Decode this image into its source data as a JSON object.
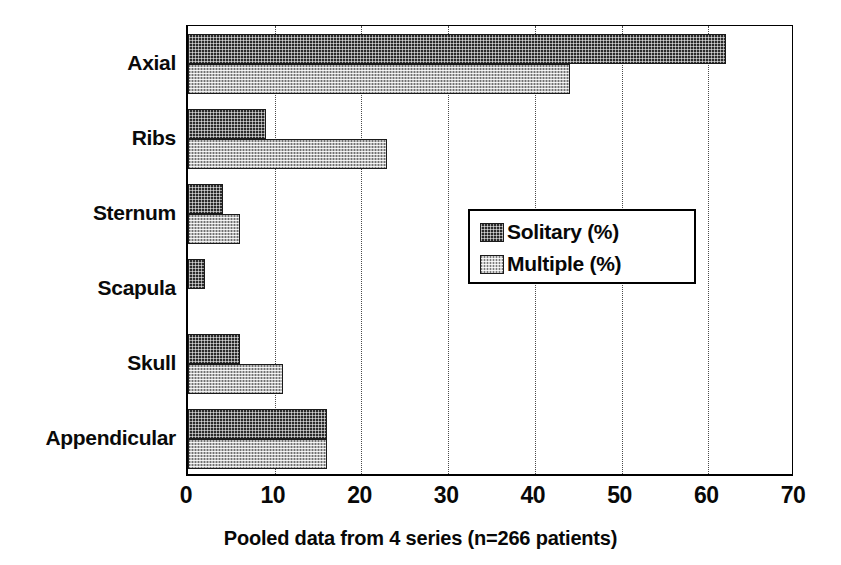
{
  "chart_data": {
    "type": "bar",
    "orientation": "horizontal",
    "title": "",
    "subtitle": "",
    "caption": "Pooled data from 4 series (n=266 patients)",
    "xlabel": "",
    "ylabel": "",
    "xlim": [
      0,
      70
    ],
    "xticks": [
      0,
      10,
      20,
      30,
      40,
      50,
      60,
      70
    ],
    "xtick_labels": [
      "0",
      "10",
      "20",
      "30",
      "40",
      "50",
      "60",
      "70"
    ],
    "grid": "vertical-dotted",
    "legend_position": "center-right-inside",
    "categories": [
      "Axial",
      "Ribs",
      "Sternum",
      "Scapula",
      "Skull",
      "Appendicular"
    ],
    "series": [
      {
        "name": "Solitary (%)",
        "fill": "dark-checker",
        "color": "#2a2a2a",
        "values": [
          62,
          9,
          4,
          2,
          6,
          16
        ]
      },
      {
        "name": "Multiple (%)",
        "fill": "light-checker",
        "color": "#b9b9b9",
        "values": [
          44,
          23,
          6,
          0,
          11,
          16
        ]
      }
    ]
  }
}
